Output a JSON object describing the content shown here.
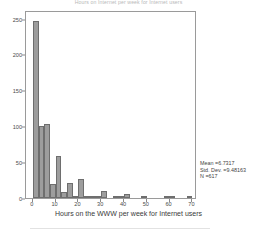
{
  "chart_data": {
    "type": "bar",
    "title": "Hours on Internet per week for Internet users",
    "xlabel": "Hours on the WWW per week for Internet users",
    "ylabel": "Frequency",
    "xlim": [
      -3,
      72
    ],
    "ylim": [
      0,
      262
    ],
    "grid": false,
    "legend_position": "none",
    "bin_width": 2.5,
    "xticks": [
      "0",
      "10",
      "20",
      "30",
      "40",
      "50",
      "60",
      "70"
    ],
    "xtick_values": [
      0,
      10,
      20,
      30,
      40,
      50,
      60,
      70
    ],
    "yticks": [
      "0",
      "50",
      "100",
      "150",
      "200",
      "250"
    ],
    "ytick_values": [
      0,
      50,
      100,
      150,
      200,
      250
    ],
    "bar_color": "#9d9d9d",
    "bar_edge_color": "#6e6e6e",
    "frame_color": "#9a9a9a",
    "x": [
      1.25,
      3.75,
      6.25,
      8.75,
      11.25,
      13.75,
      16.25,
      18.75,
      21.25,
      23.75,
      26.25,
      28.75,
      31.25,
      33.75,
      36.25,
      38.75,
      41.25,
      43.75,
      46.25,
      48.75,
      51.25,
      58.75,
      61.25,
      68.75
    ],
    "values": [
      247,
      101,
      103,
      20,
      58,
      9,
      21,
      2,
      26,
      1,
      3,
      2,
      10,
      0,
      1,
      1,
      5,
      0,
      0,
      2,
      0,
      1,
      1,
      1
    ],
    "bin_starts": [
      0,
      2.5,
      5,
      7.5,
      10,
      12.5,
      15,
      17.5,
      20,
      22.5,
      25,
      27.5,
      30,
      32.5,
      35,
      37.5,
      40,
      42.5,
      45,
      47.5,
      50,
      57.5,
      60,
      67.5
    ],
    "annotations": {
      "mean_label": "Mean =6.7317",
      "std_dev_label": "Std. Dev. =9.48163",
      "n_label": "N =617",
      "mean": 6.7317,
      "std_dev": 9.48163,
      "n": 617
    }
  }
}
